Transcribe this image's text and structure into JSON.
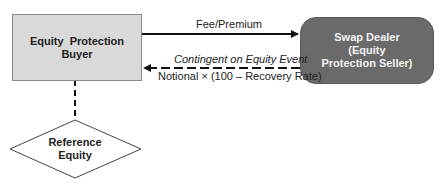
{
  "diagram": {
    "nodes": {
      "buyer": {
        "line1": "Equity  Protection",
        "line2": "Buyer",
        "fill": "#d9d9d9"
      },
      "dealer": {
        "line1": "Swap Dealer",
        "line2": "(Equity",
        "line3": "Protection Seller)",
        "fill": "#6a6a6a"
      },
      "reference": {
        "line1": "Reference",
        "line2": "Equity"
      }
    },
    "edges": {
      "fee": {
        "label": "Fee/Premium",
        "from": "buyer",
        "to": "dealer",
        "style": "solid"
      },
      "contingent": {
        "label_top": "Contingent on Equity Event",
        "label_bottom": "Notional × (100 – Recovery Rate)",
        "from": "dealer",
        "to": "buyer",
        "style": "dashed"
      },
      "reference_link": {
        "from": "buyer",
        "to": "reference",
        "style": "dashed"
      }
    }
  }
}
